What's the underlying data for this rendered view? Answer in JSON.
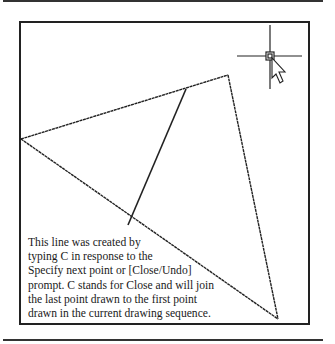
{
  "figure": {
    "caption_lines": [
      "This line was created by",
      "typing C in response to the",
      "Specify next point or [Close/Undo]",
      "prompt. C stands for Close and will join",
      "the last point drawn to the first point",
      "drawn in the current drawing sequence."
    ],
    "icons": {
      "crosshair": "crosshair-cursor-icon",
      "pointer": "arrow-pointer-icon"
    },
    "colors": {
      "line": "#222222",
      "background": "#ffffff"
    }
  }
}
